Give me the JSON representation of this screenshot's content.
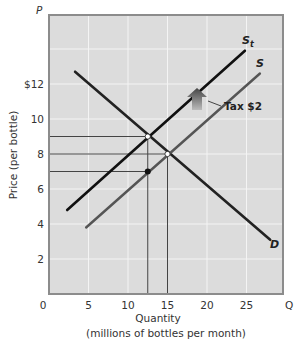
{
  "chart_data": {
    "type": "line",
    "title": "",
    "xlabel": "Quantity",
    "xlabel_sub": "(millions of bottles per month)",
    "ylabel": "Price (per bottle)",
    "x_axis_symbol": "Q",
    "y_axis_symbol": "P",
    "xlim": [
      0,
      30
    ],
    "ylim": [
      0,
      16
    ],
    "x_ticks": [
      {
        "value": 0,
        "label": "0"
      },
      {
        "value": 5,
        "label": "5"
      },
      {
        "value": 10,
        "label": "10"
      },
      {
        "value": 15,
        "label": "15"
      },
      {
        "value": 20,
        "label": "20"
      },
      {
        "value": 25,
        "label": "25"
      }
    ],
    "y_ticks": [
      {
        "value": 2,
        "label": "2"
      },
      {
        "value": 4,
        "label": "4"
      },
      {
        "value": 6,
        "label": "6"
      },
      {
        "value": 8,
        "label": "8"
      },
      {
        "value": 10,
        "label": "10"
      },
      {
        "value": 12,
        "label": "$12"
      }
    ],
    "grid": true,
    "series": [
      {
        "name": "D",
        "label": "D",
        "color": "#222222",
        "points": [
          [
            3.3,
            12.7
          ],
          [
            28.0,
            3.1
          ]
        ]
      },
      {
        "name": "S",
        "label": "S",
        "color": "#555555",
        "points": [
          [
            4.7,
            3.8
          ],
          [
            26.7,
            12.6
          ]
        ]
      },
      {
        "name": "St",
        "label": "S",
        "subscript": "t",
        "color": "#111111",
        "points": [
          [
            2.3,
            4.8
          ],
          [
            24.8,
            13.9
          ]
        ]
      }
    ],
    "equilibria": [
      {
        "name": "original",
        "q": 15,
        "p": 8,
        "style": "open"
      },
      {
        "name": "with_tax_buyer_price",
        "q": 12.5,
        "p": 9,
        "style": "open"
      },
      {
        "name": "with_tax_seller_price",
        "q": 12.5,
        "p": 7,
        "style": "filled"
      }
    ],
    "reference_lines": {
      "horizontal": [
        9,
        8,
        7
      ],
      "vertical": [
        12.5,
        15
      ]
    },
    "annotations": [
      {
        "text": "Tax $2",
        "arrow": "up",
        "at": [
          19.5,
          10.5
        ]
      }
    ]
  }
}
